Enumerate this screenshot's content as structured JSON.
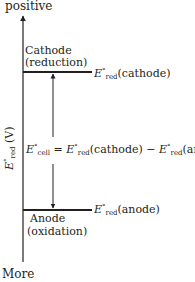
{
  "axis": {
    "top_label": "positive",
    "bottom_label": "More",
    "y_label_symbol": "E",
    "y_label_sup": "°",
    "y_label_sub": "red",
    "y_label_unit": "(V)"
  },
  "cathode": {
    "name": "Cathode",
    "process": "(reduction)",
    "symbol": "E",
    "sup": "°",
    "sub": "red",
    "paren": "(cathode)"
  },
  "anode": {
    "name": "Anode",
    "process": "(oxidation)",
    "symbol": "E",
    "sup": "°",
    "sub": "red",
    "paren": "(anode)"
  },
  "equation": {
    "lhs_symbol": "E",
    "lhs_sup": "°",
    "lhs_sub": "cell",
    "equals": "=",
    "t1_symbol": "E",
    "t1_sup": "°",
    "t1_sub": "red",
    "t1_paren": "(cathode)",
    "minus": "−",
    "t2_symbol": "E",
    "t2_sup": "°",
    "t2_sub": "red",
    "t2_paren": "(anode)"
  },
  "colors": {
    "ink": "#231f20"
  }
}
